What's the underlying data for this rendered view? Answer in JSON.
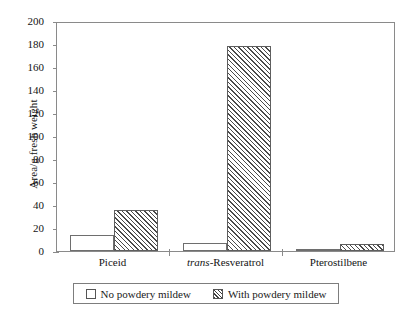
{
  "chart_data": {
    "type": "bar",
    "title": "",
    "xlabel": "",
    "ylabel": "Area/g fresh weight",
    "ylim": [
      0,
      200
    ],
    "yticks": [
      0,
      20,
      40,
      60,
      80,
      100,
      120,
      140,
      160,
      180,
      200
    ],
    "grid": false,
    "legend_position": "below-axis-centered",
    "categories": [
      "Piceid",
      "trans-Resveratrol",
      "Pterostilbene"
    ],
    "categories_rich": [
      {
        "prefix_italic": "",
        "text": "Piceid"
      },
      {
        "prefix_italic": "trans",
        "text": "-Resveratrol"
      },
      {
        "prefix_italic": "",
        "text": "Pterostilbene"
      }
    ],
    "series": [
      {
        "name": "No powdery mildew",
        "style": "open",
        "values": [
          14,
          7,
          1.5
        ]
      },
      {
        "name": "With powdery mildew",
        "style": "hatched",
        "values": [
          36,
          178,
          6
        ]
      }
    ]
  },
  "legend": {
    "items": [
      {
        "label": "No powdery mildew",
        "style": "open"
      },
      {
        "label": "With powdery mildew",
        "style": "hatched"
      }
    ]
  },
  "colors": {
    "axis": "#8a8a8a",
    "text": "#141414",
    "bar_outline": "#6e6e6e",
    "hatch": "#4a4a4a",
    "background": "#ffffff"
  }
}
